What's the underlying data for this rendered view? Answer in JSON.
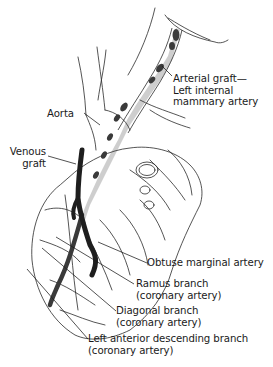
{
  "diagram": {
    "type": "anatomical-illustration",
    "colors": {
      "line": "#2a2a2a",
      "graft": "#3a3a3a",
      "background": "#ffffff"
    },
    "labels": {
      "arterial_graft": {
        "line1": "Arterial graft—",
        "line2": "Left internal",
        "line3": "mammary artery"
      },
      "aorta": {
        "line1": "Aorta"
      },
      "venous_graft": {
        "line1": "Venous",
        "line2": "graft"
      },
      "obtuse_marginal": {
        "line1": "Obtuse marginal artery"
      },
      "ramus": {
        "line1": "Ramus branch",
        "line2": "(coronary artery)"
      },
      "diagonal": {
        "line1": "Diagonal branch",
        "line2": "(coronary artery)"
      },
      "lad": {
        "line1": "Left anterior descending branch",
        "line2": "(coronary artery)"
      }
    }
  }
}
